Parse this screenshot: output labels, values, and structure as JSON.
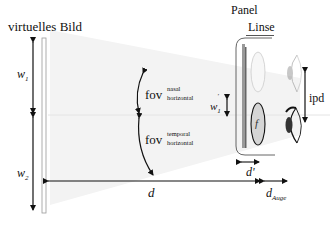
{
  "labels": {
    "virtual_image": "virtuelles Bild",
    "panel": "Panel",
    "lens": "Linse",
    "w1": "w",
    "w1_sub": "1",
    "w2": "w",
    "w2_sub": "2",
    "w1_prime": "w",
    "w1_prime_sup": "'",
    "w1_prime_sub": "1",
    "fov": "fov",
    "fov_nasal_sup": "nasal",
    "fov_nasal_sub": "horizontal",
    "fov_temporal_sup": "temporal",
    "fov_temporal_sub": "horizontal",
    "lens_focal": "f",
    "ipd": "ipd",
    "d": "d",
    "d_prime": "d'",
    "d_eye": "d",
    "d_eye_sub": "Auge"
  },
  "colors": {
    "line": "#111111",
    "virtual_image_bar": "#aaaaaa",
    "frustum": "#f1f1f1",
    "midline": "#e2e2e2",
    "panel_bar": "#888888",
    "lens_fill": "#d9d9d9",
    "lens_faded": "#f0f0f0",
    "eye_iris": "#333333"
  }
}
